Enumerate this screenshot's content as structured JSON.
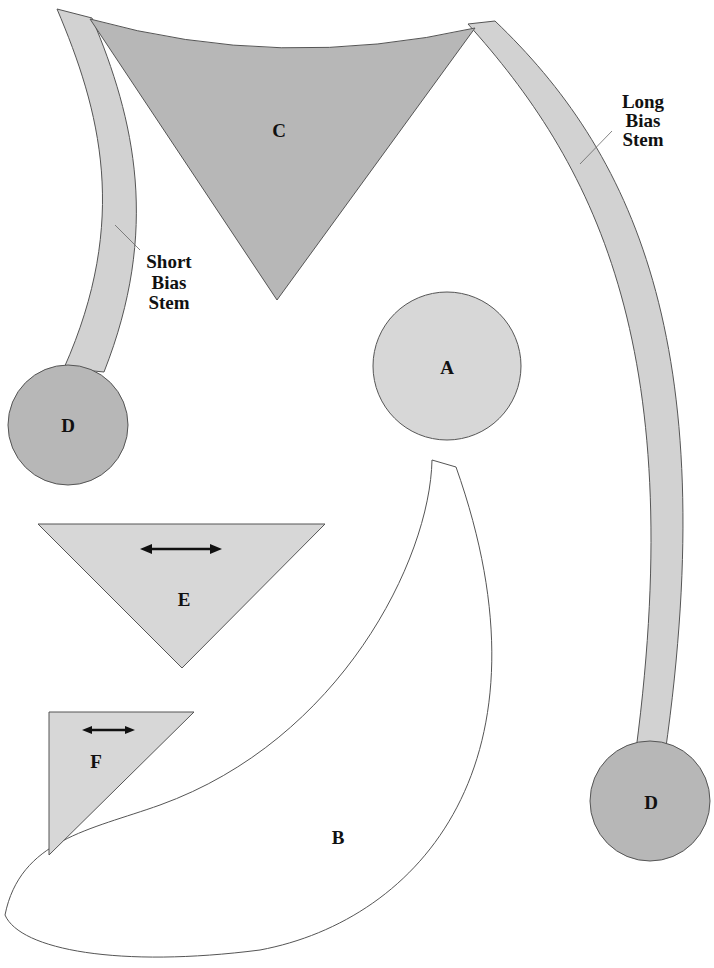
{
  "diagram": {
    "colors": {
      "dark_fill": "#b7b7b7",
      "light_fill": "#d7d7d7",
      "stem_fill": "#d2d2d2",
      "b_fill": "#ffffff",
      "outline": "#555555",
      "arrow": "#111111"
    },
    "pieces": {
      "a": {
        "letter": "A"
      },
      "b": {
        "letter": "B"
      },
      "c": {
        "letter": "C"
      },
      "d1": {
        "letter": "D"
      },
      "d2": {
        "letter": "D"
      },
      "e": {
        "letter": "E",
        "grainline": "double-arrow"
      },
      "f": {
        "letter": "F",
        "grainline": "double-arrow"
      }
    },
    "callouts": {
      "short_stem": [
        "Short",
        "Bias",
        "Stem"
      ],
      "long_stem": [
        "Long",
        "Bias",
        "Stem"
      ]
    }
  }
}
